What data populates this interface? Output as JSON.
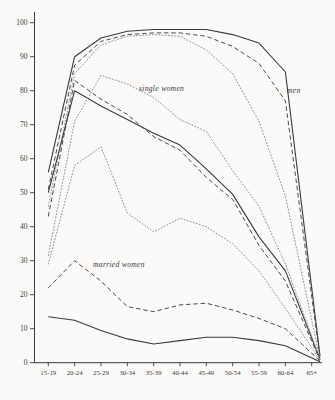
{
  "figure": {
    "background": "#fbfaf8",
    "ink_color": "#3a3a3a",
    "dashed_color": "#4a4a4a",
    "dotted_color": "#8f8f8f"
  },
  "chart_data": {
    "type": "line",
    "title": "",
    "xlabel": "",
    "ylabel": "",
    "grid": false,
    "legend_position": "none",
    "categories": [
      "15-19",
      "20-24",
      "25-29",
      "30-34",
      "35-39",
      "40-44",
      "45-49",
      "50-54",
      "55-59",
      "60-64",
      "65+"
    ],
    "y_axis": {
      "min": 0,
      "max": 100,
      "tick_step": 10,
      "tick_labels": [
        "0",
        "10",
        "20",
        "30",
        "40",
        "50",
        "60",
        "70",
        "80",
        "90",
        "100"
      ]
    },
    "series": [
      {
        "name": "men-solid",
        "group": "men",
        "style": "solid",
        "color": "#3a3a3a",
        "values": [
          56,
          90,
          95.5,
          97.5,
          98,
          98,
          98,
          96.5,
          94,
          85.5,
          2
        ]
      },
      {
        "name": "men-dashed",
        "group": "men",
        "style": "dashed",
        "color": "#4a4a4a",
        "values": [
          51,
          87.5,
          94.5,
          96.5,
          97,
          97,
          96,
          93,
          88,
          77,
          1.5
        ]
      },
      {
        "name": "men-dotted",
        "group": "men",
        "style": "dotted",
        "color": "#8f8f8f",
        "values": [
          46,
          85,
          93.5,
          96,
          96.5,
          96,
          92,
          85,
          71,
          49,
          1
        ]
      },
      {
        "name": "single-women-solid",
        "group": "single women",
        "style": "solid",
        "color": "#3a3a3a",
        "values": [
          50,
          80,
          75.5,
          71.5,
          67.5,
          64,
          57,
          49.5,
          37,
          27,
          1
        ]
      },
      {
        "name": "single-women-dashed",
        "group": "single women",
        "style": "dashed",
        "color": "#4a4a4a",
        "values": [
          43,
          83,
          77.5,
          73,
          66.5,
          62.5,
          54.5,
          48,
          34.5,
          24,
          0.8
        ]
      },
      {
        "name": "single-women-dotted",
        "group": "single women",
        "style": "dotted",
        "color": "#8f8f8f",
        "values": [
          31.5,
          71,
          84.5,
          82,
          78,
          71.5,
          68,
          56.5,
          46,
          29,
          1.2
        ]
      },
      {
        "name": "married-women-solid",
        "group": "married women",
        "style": "solid",
        "color": "#3a3a3a",
        "values": [
          13.5,
          12.5,
          9.5,
          7,
          5.5,
          6.5,
          7.5,
          7.5,
          6.5,
          5,
          0.3
        ]
      },
      {
        "name": "married-women-dashed",
        "group": "married women",
        "style": "dashed",
        "color": "#4a4a4a",
        "values": [
          22,
          30,
          24,
          16.5,
          15,
          17,
          17.5,
          15.5,
          13,
          10,
          0.5
        ]
      },
      {
        "name": "married-women-dotted",
        "group": "married women",
        "style": "dotted",
        "color": "#8f8f8f",
        "values": [
          29,
          58,
          63.5,
          44,
          38.5,
          42.5,
          40,
          35,
          27,
          16,
          0.8
        ]
      }
    ],
    "annotations": [
      {
        "text": "single women",
        "x_px": 139,
        "y_px": 91
      },
      {
        "text": "men",
        "x_px": 287,
        "y_px": 93
      },
      {
        "text": "married women",
        "x_px": 93,
        "y_px": 267
      }
    ]
  }
}
